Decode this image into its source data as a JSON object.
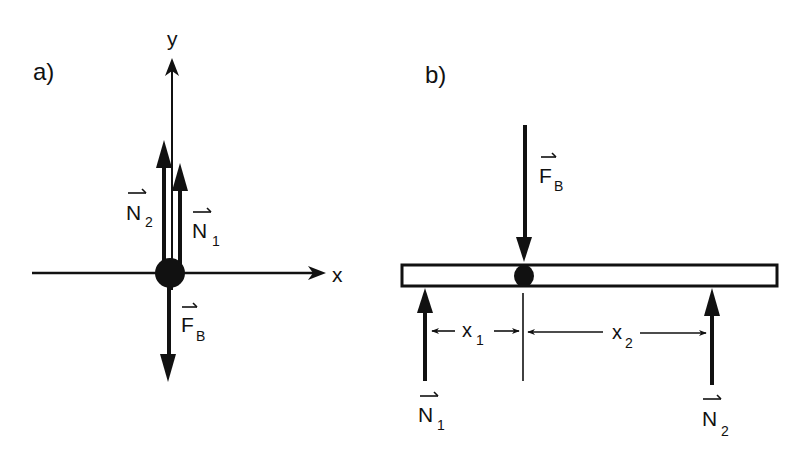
{
  "figure": {
    "panels": [
      {
        "id": "a",
        "label": "a)",
        "axes": {
          "x_label": "x",
          "y_label": "y"
        },
        "vectors": [
          {
            "name": "N",
            "subscript": "2",
            "direction": "up"
          },
          {
            "name": "N",
            "subscript": "1",
            "direction": "up"
          },
          {
            "name": "F",
            "subscript": "B",
            "direction": "down"
          }
        ]
      },
      {
        "id": "b",
        "label": "b)",
        "vectors": [
          {
            "name": "F",
            "subscript": "B",
            "direction": "down"
          },
          {
            "name": "N",
            "subscript": "1",
            "direction": "up"
          },
          {
            "name": "N",
            "subscript": "2",
            "direction": "up"
          }
        ],
        "dimensions": [
          {
            "name": "x",
            "subscript": "1"
          },
          {
            "name": "x",
            "subscript": "2"
          }
        ]
      }
    ],
    "colors": {
      "ink": "#111111",
      "background": "#ffffff"
    }
  }
}
